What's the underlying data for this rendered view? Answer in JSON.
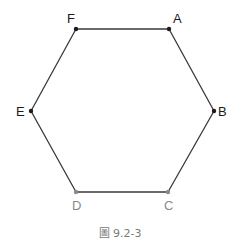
{
  "figure": {
    "caption": "圖 9.2-3",
    "shape": "regular-hexagon",
    "stroke_color": "#3a3a3a",
    "vertices": [
      {
        "label": "A",
        "x": 169,
        "y": 29,
        "label_x": 173,
        "label_y": 23,
        "color": "#1a1a1a"
      },
      {
        "label": "B",
        "x": 214,
        "y": 111,
        "label_x": 218,
        "label_y": 116,
        "color": "#1a1a1a"
      },
      {
        "label": "C",
        "x": 168,
        "y": 192,
        "label_x": 164,
        "label_y": 210,
        "color": "#8a8a8a"
      },
      {
        "label": "D",
        "x": 76,
        "y": 192,
        "label_x": 72,
        "label_y": 210,
        "color": "#8a8a8a"
      },
      {
        "label": "E",
        "x": 31,
        "y": 111,
        "label_x": 16,
        "label_y": 116,
        "color": "#1a1a1a"
      },
      {
        "label": "F",
        "x": 76,
        "y": 29,
        "label_x": 67,
        "label_y": 23,
        "color": "#1a1a1a"
      }
    ]
  }
}
